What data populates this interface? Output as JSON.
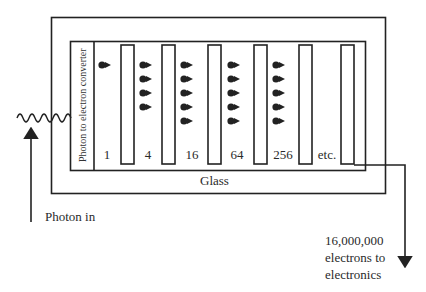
{
  "diagram": {
    "converter_label": "Photon to electron converter",
    "glass_label": "Glass",
    "input_label": "Photon in",
    "output_label_lines": [
      "16,000,000",
      "electrons to",
      "electronics"
    ],
    "stages": [
      {
        "label": "1",
        "electrons_shown": 1
      },
      {
        "label": "4",
        "electrons_shown": 4
      },
      {
        "label": "16",
        "electrons_shown": 5
      },
      {
        "label": "64",
        "electrons_shown": 5
      },
      {
        "label": "256",
        "electrons_shown": 5
      },
      {
        "label": "etc.",
        "electrons_shown": 0
      }
    ],
    "colors": {
      "line": "#222222",
      "background": "#ffffff"
    }
  }
}
